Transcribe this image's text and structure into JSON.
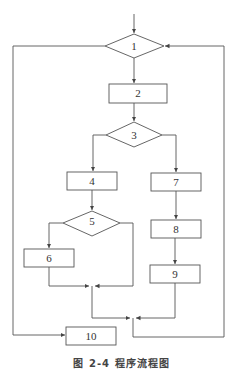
{
  "diagram": {
    "type": "flowchart",
    "nodes": [
      {
        "id": "1",
        "shape": "diamond",
        "label": "1"
      },
      {
        "id": "2",
        "shape": "rect",
        "label": "2"
      },
      {
        "id": "3",
        "shape": "diamond",
        "label": "3"
      },
      {
        "id": "4",
        "shape": "rect",
        "label": "4"
      },
      {
        "id": "5",
        "shape": "diamond",
        "label": "5"
      },
      {
        "id": "6",
        "shape": "rect",
        "label": "6"
      },
      {
        "id": "7",
        "shape": "rect",
        "label": "7"
      },
      {
        "id": "8",
        "shape": "rect",
        "label": "8"
      },
      {
        "id": "9",
        "shape": "rect",
        "label": "9"
      },
      {
        "id": "10",
        "shape": "rect",
        "label": "10"
      }
    ],
    "edges": [
      [
        "start",
        "1"
      ],
      [
        "1",
        "2"
      ],
      [
        "1",
        "10"
      ],
      [
        "2",
        "3"
      ],
      [
        "3",
        "4"
      ],
      [
        "3",
        "7"
      ],
      [
        "4",
        "5"
      ],
      [
        "5",
        "6"
      ],
      [
        "5",
        "merge_a"
      ],
      [
        "6",
        "merge_a"
      ],
      [
        "7",
        "8"
      ],
      [
        "8",
        "9"
      ],
      [
        "merge_a",
        "merge_b"
      ],
      [
        "9",
        "merge_b"
      ],
      [
        "merge_b",
        "1"
      ]
    ],
    "line_color": "#555555"
  },
  "caption": "图 2-4   程序流程图"
}
